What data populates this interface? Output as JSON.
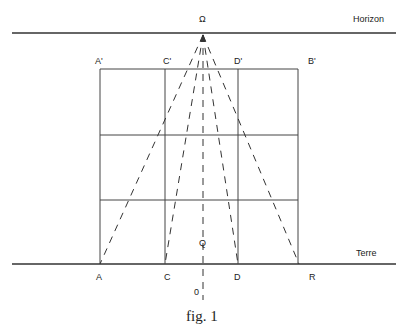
{
  "labels": {
    "omega": "Ω",
    "horizon": "Horizon",
    "terre": "Terre",
    "a_prime": "A'",
    "c_prime": "C'",
    "d_prime": "D'",
    "b_prime": "B'",
    "a": "A",
    "c": "C",
    "d": "D",
    "r": "R",
    "q": "Q",
    "o": "0"
  },
  "caption": "fig. 1",
  "colors": {
    "line": "#333333",
    "text": "#222222",
    "background": "#ffffff"
  }
}
